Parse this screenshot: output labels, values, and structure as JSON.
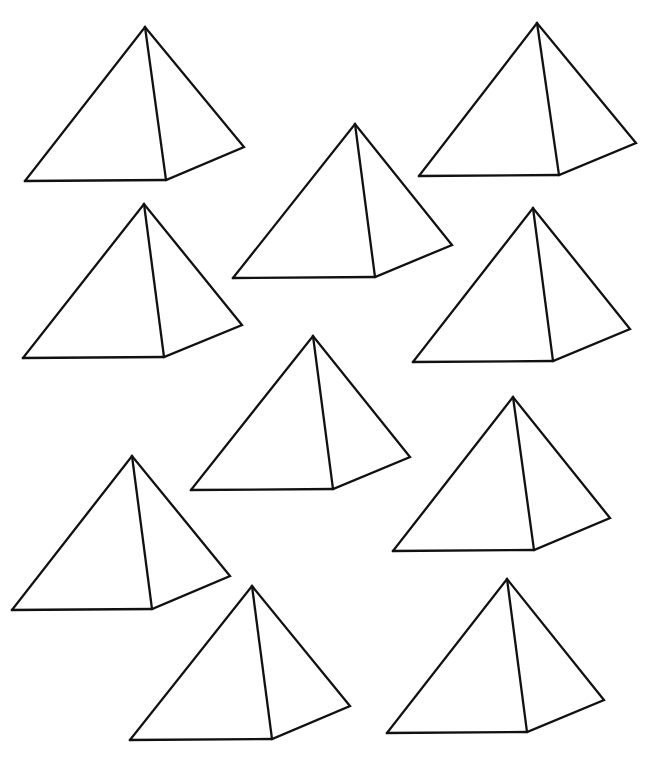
{
  "shape_kind": "square pyramid outline",
  "pyramid_count": 10,
  "colors": {
    "line": "#111111",
    "background": "#ffffff"
  },
  "pyramids": [
    {
      "id": "pyramid-1",
      "label": "top-left"
    },
    {
      "id": "pyramid-2",
      "label": "top-right"
    },
    {
      "id": "pyramid-3",
      "label": "upper-center"
    },
    {
      "id": "pyramid-4",
      "label": "second-row-left"
    },
    {
      "id": "pyramid-5",
      "label": "second-row-right"
    },
    {
      "id": "pyramid-6",
      "label": "center"
    },
    {
      "id": "pyramid-7",
      "label": "middle-right"
    },
    {
      "id": "pyramid-8",
      "label": "lower-left"
    },
    {
      "id": "pyramid-9",
      "label": "bottom-center"
    },
    {
      "id": "pyramid-10",
      "label": "bottom-right"
    }
  ]
}
